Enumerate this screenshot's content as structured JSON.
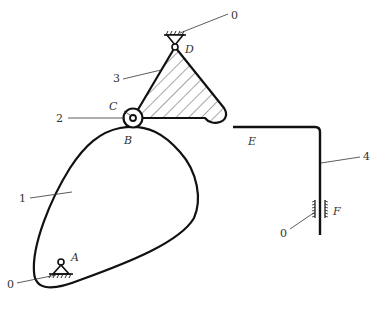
{
  "diagram": {
    "type": "cam-linkage mechanism",
    "colors": {
      "line": "#111111",
      "label": "#333333",
      "background": "#ffffff"
    },
    "part_labels": {
      "ground_top": "0",
      "cam": "1",
      "roller": "2",
      "link": "3",
      "follower": "4",
      "ground_guide": "0",
      "ground_cam": "0"
    },
    "point_labels": {
      "A": "A",
      "B": "B",
      "C": "C",
      "D": "D",
      "E": "E",
      "F": "F"
    }
  }
}
